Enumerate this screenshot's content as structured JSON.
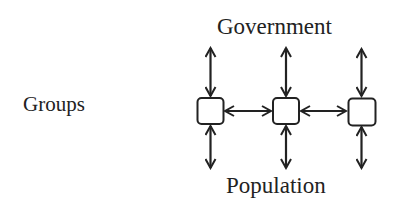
{
  "diagram": {
    "title_top": "Government",
    "title_bottom": "Population",
    "row_label": "Groups",
    "colors": {
      "stroke": "#222222",
      "text": "#222222",
      "background": "#ffffff",
      "node_fill": "#ffffff"
    },
    "nodes": [
      {
        "id": "group-1",
        "cx": 210,
        "cy": 111
      },
      {
        "id": "group-2",
        "cx": 286,
        "cy": 111
      },
      {
        "id": "group-3",
        "cx": 362,
        "cy": 111
      }
    ],
    "edges": [
      {
        "from": "government",
        "to": "group-1",
        "type": "bidirectional"
      },
      {
        "from": "government",
        "to": "group-2",
        "type": "bidirectional"
      },
      {
        "from": "government",
        "to": "group-3",
        "type": "bidirectional"
      },
      {
        "from": "group-1",
        "to": "group-2",
        "type": "bidirectional"
      },
      {
        "from": "group-2",
        "to": "group-3",
        "type": "bidirectional"
      },
      {
        "from": "group-1",
        "to": "population",
        "type": "bidirectional"
      },
      {
        "from": "group-2",
        "to": "population",
        "type": "bidirectional"
      },
      {
        "from": "group-3",
        "to": "population",
        "type": "bidirectional"
      }
    ]
  }
}
